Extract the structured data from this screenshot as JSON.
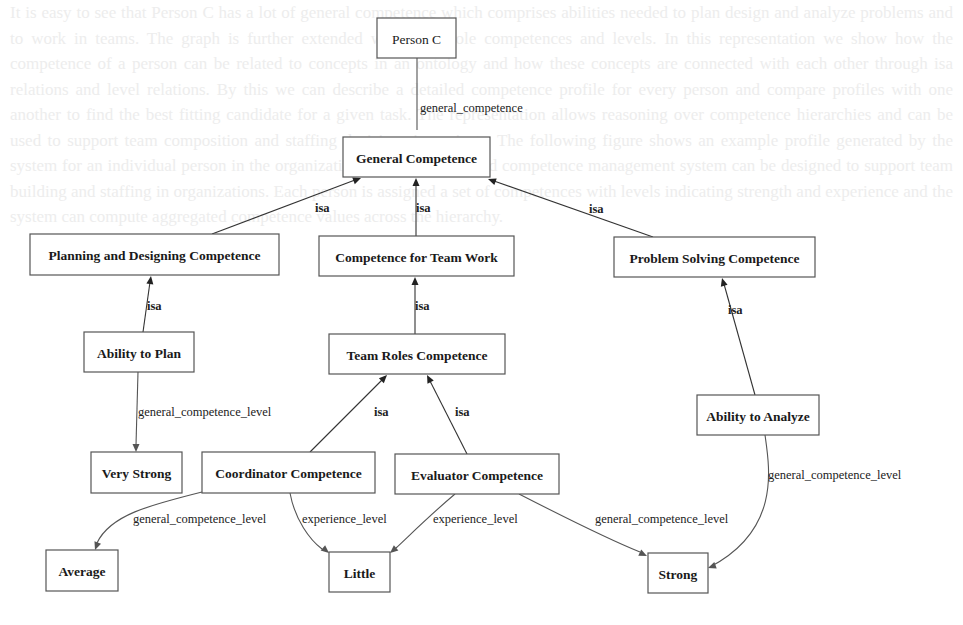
{
  "diagram": {
    "type": "graphviz-concept-graph",
    "background_text_faded": true,
    "nodes": [
      {
        "id": "person_c",
        "label": "Person C",
        "x": 377,
        "y": 18,
        "w": 79,
        "h": 40,
        "bold": false
      },
      {
        "id": "general_competence",
        "label": "General Competence",
        "x": 343,
        "y": 137,
        "w": 147,
        "h": 40,
        "bold": true
      },
      {
        "id": "planning_designing",
        "label": "Planning and Designing Competence",
        "x": 30,
        "y": 234,
        "w": 249,
        "h": 41,
        "bold": true
      },
      {
        "id": "team_work",
        "label": "Competence for Team Work",
        "x": 319,
        "y": 236,
        "w": 195,
        "h": 40,
        "bold": true
      },
      {
        "id": "problem_solving",
        "label": "Problem Solving Competence",
        "x": 614,
        "y": 237,
        "w": 201,
        "h": 40,
        "bold": true
      },
      {
        "id": "ability_plan",
        "label": "Ability to Plan",
        "x": 84,
        "y": 332,
        "w": 110,
        "h": 40,
        "bold": true
      },
      {
        "id": "team_roles",
        "label": "Team Roles Competence",
        "x": 329,
        "y": 334,
        "w": 176,
        "h": 40,
        "bold": true
      },
      {
        "id": "ability_analyze",
        "label": "Ability to Analyze",
        "x": 697,
        "y": 395,
        "w": 122,
        "h": 40,
        "bold": true
      },
      {
        "id": "very_strong",
        "label": "Very Strong",
        "x": 91,
        "y": 452,
        "w": 91,
        "h": 41,
        "bold": true
      },
      {
        "id": "coordinator",
        "label": "Coordinator Competence",
        "x": 202,
        "y": 452,
        "w": 173,
        "h": 41,
        "bold": true
      },
      {
        "id": "evaluator",
        "label": "Evaluator Competence",
        "x": 395,
        "y": 454,
        "w": 164,
        "h": 40,
        "bold": true
      },
      {
        "id": "average",
        "label": "Average",
        "x": 46,
        "y": 550,
        "w": 72,
        "h": 41,
        "bold": true
      },
      {
        "id": "little",
        "label": "Little",
        "x": 329,
        "y": 552,
        "w": 61,
        "h": 40,
        "bold": true
      },
      {
        "id": "strong",
        "label": "Strong",
        "x": 648,
        "y": 553,
        "w": 60,
        "h": 40,
        "bold": true
      }
    ],
    "edges": [
      {
        "from": "person_c",
        "to": "general_competence",
        "label": "general_competence",
        "kind": "relation",
        "path": "M417,58 L417,130",
        "arrow": [
          417,
          137,
          270
        ],
        "lx": 420,
        "ly": 112
      },
      {
        "from": "planning_designing",
        "to": "general_competence",
        "label": "isa",
        "kind": "isa",
        "path": "M212,234 L355,180",
        "arrow": [
          361,
          178,
          -21
        ],
        "lx": 315,
        "ly": 212
      },
      {
        "from": "team_work",
        "to": "general_competence",
        "label": "isa",
        "kind": "isa",
        "path": "M416,236 L416,184",
        "arrow": [
          416,
          178,
          -90
        ],
        "lx": 416,
        "ly": 212
      },
      {
        "from": "problem_solving",
        "to": "general_competence",
        "label": "isa",
        "kind": "isa",
        "path": "M653,237 L494,181",
        "arrow": [
          488,
          179,
          -160
        ],
        "lx": 589,
        "ly": 213
      },
      {
        "from": "ability_plan",
        "to": "planning_designing",
        "label": "isa",
        "kind": "isa",
        "path": "M143,332 L150,282",
        "arrow": [
          151,
          276,
          -82
        ],
        "lx": 147,
        "ly": 310
      },
      {
        "from": "team_roles",
        "to": "team_work",
        "label": "isa",
        "kind": "isa",
        "path": "M415,334 L415,283",
        "arrow": [
          415,
          277,
          -90
        ],
        "lx": 415,
        "ly": 310
      },
      {
        "from": "ability_analyze",
        "to": "problem_solving",
        "label": "isa",
        "kind": "isa",
        "path": "M755,395 L724,284",
        "arrow": [
          722,
          278,
          -106
        ],
        "lx": 728,
        "ly": 314
      },
      {
        "from": "ability_plan",
        "to": "very_strong",
        "label": "general_competence_level",
        "kind": "relation",
        "path": "M138,372 L136,445",
        "arrow": [
          136,
          452,
          90
        ],
        "lx": 138,
        "ly": 416
      },
      {
        "from": "coordinator",
        "to": "team_roles",
        "label": "isa",
        "kind": "isa",
        "path": "M310,452 L382,380",
        "arrow": [
          387,
          375,
          -45
        ],
        "lx": 374,
        "ly": 416
      },
      {
        "from": "evaluator",
        "to": "team_roles",
        "label": "isa",
        "kind": "isa",
        "path": "M467,454 L430,381",
        "arrow": [
          427,
          375,
          -117
        ],
        "lx": 455,
        "ly": 416
      },
      {
        "from": "ability_analyze",
        "to": "strong",
        "label": "general_competence_level",
        "kind": "relation",
        "path": "M765,435 C770,470 780,530 710,567",
        "arrow": [
          708,
          568,
          160
        ],
        "lx": 768,
        "ly": 479
      },
      {
        "from": "coordinator",
        "to": "average",
        "label": "general_competence_level",
        "kind": "relation",
        "path": "M202,492 C150,505 110,515 97,543",
        "arrow": [
          95,
          550,
          110
        ],
        "lx": 133,
        "ly": 523
      },
      {
        "from": "coordinator",
        "to": "little",
        "label": "experience_level",
        "kind": "relation",
        "path": "M290,493 C295,520 310,540 322,549",
        "arrow": [
          329,
          553,
          40
        ],
        "lx": 302,
        "ly": 523
      },
      {
        "from": "evaluator",
        "to": "little",
        "label": "experience_level",
        "kind": "relation",
        "path": "M455,494 C430,515 410,535 396,548",
        "arrow": [
          390,
          553,
          140
        ],
        "lx": 433,
        "ly": 523
      },
      {
        "from": "evaluator",
        "to": "strong",
        "label": "general_competence_level",
        "kind": "relation",
        "path": "M519,494 C560,515 610,540 640,552",
        "arrow": [
          647,
          556,
          25
        ],
        "lx": 595,
        "ly": 523
      }
    ]
  },
  "background_text": "It is easy to see that Person C has a lot of general competence which comprises abilities needed to plan design and analyze problems and to work in teams. The graph is further extended with team role competences and levels. In this representation we show how the competence of a person can be related to concepts in an ontology and how these concepts are connected with each other through isa relations and level relations. By this we can describe a detailed competence profile for every person and compare profiles with one another to find the best fitting candidate for a given task. The representation allows reasoning over competence hierarchies and can be used to support team composition and staffing decisions in projects. The following figure shows an example profile generated by the system for an individual person in the organization. An ontology based competence management system can be designed to support team building and staffing in organizations. Each person is assigned a set of competences with levels indicating strength and experience and the system can compute aggregated competence values across the hierarchy."
}
